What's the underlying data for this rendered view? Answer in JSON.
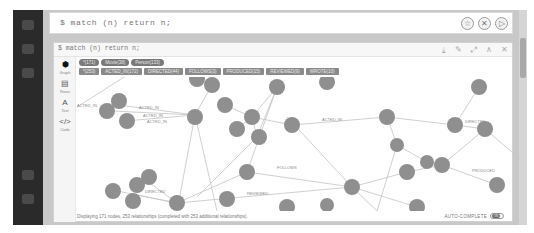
{
  "editor": {
    "code": "$ match (n) return n;",
    "actions": [
      {
        "name": "favorite-button",
        "icon": "star-icon",
        "glyph": "☆"
      },
      {
        "name": "clear-button",
        "icon": "close-circle-icon",
        "glyph": "✕"
      },
      {
        "name": "run-button",
        "icon": "play-icon",
        "glyph": "▷"
      }
    ]
  },
  "frame": {
    "title": "$ match (n) return n;",
    "actions": [
      {
        "name": "download-button",
        "icon": "download-icon",
        "glyph": "⤓"
      },
      {
        "name": "pin-button",
        "icon": "pin-icon",
        "glyph": "✎"
      },
      {
        "name": "fullscreen-button",
        "icon": "expand-icon",
        "glyph": "⤢"
      },
      {
        "name": "collapse-button",
        "icon": "chevron-up-icon",
        "glyph": "∧"
      },
      {
        "name": "close-button",
        "icon": "close-icon",
        "glyph": "✕"
      }
    ],
    "views": [
      {
        "name": "graph",
        "label": "Graph",
        "glyph": "⬢",
        "active": true
      },
      {
        "name": "rows",
        "label": "Rows",
        "glyph": "▤",
        "active": false
      },
      {
        "name": "text",
        "label": "Text",
        "glyph": "A",
        "active": false
      },
      {
        "name": "code",
        "label": "Code",
        "glyph": "</>",
        "active": false
      }
    ],
    "node_labels": [
      "*(171)",
      "Movie(38)",
      "Person(133)"
    ],
    "relationship_types": [
      "*(253)",
      "ACTED_IN(172)",
      "DIRECTED(44)",
      "FOLLOWS(3)",
      "PRODUCED(15)",
      "REVIEWED(9)",
      "WROTE(10)"
    ],
    "status": "Displaying 171 nodes, 253 relationships (completed with 253 additional relationships).",
    "autocomplete": {
      "label": "AUTO-COMPLETE",
      "state": "ON"
    }
  },
  "graph": {
    "node_color": "#8c8c8c",
    "edge_color": "#c2c2c2",
    "edge_labels": [
      "ACTED_IN",
      "ACTED_IN",
      "ACTED_IN",
      "ACTED_IN",
      "DIRECTED",
      "FOLLOWS",
      "REVIEWED",
      "DIRECTED",
      "PRODUCED",
      "ACTED_IN"
    ]
  }
}
